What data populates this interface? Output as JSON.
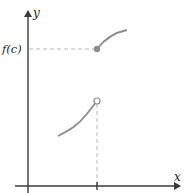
{
  "diagram": {
    "type": "piecewise-function-jump-discontinuity",
    "axes": {
      "x_label": "x",
      "y_label": "y",
      "x_tick_label": "c"
    },
    "labels": {
      "fc": "f(c)"
    },
    "points": {
      "filled": {
        "meaning": "(c, f(c))",
        "state": "filled"
      },
      "open": {
        "meaning": "left limit at c",
        "state": "open"
      }
    },
    "colors": {
      "axis": "#3a3a3a",
      "curve": "#8c8c8c",
      "dash": "#b8b8b8",
      "filled_dot": "#8c8c8c",
      "open_dot_stroke": "#8c8c8c",
      "text": "#231f20"
    }
  }
}
